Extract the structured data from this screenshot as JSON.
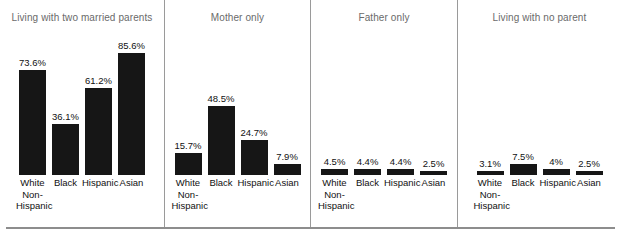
{
  "chart_data": {
    "type": "bar",
    "title": "",
    "xlabel": "",
    "ylabel": "",
    "ylim": [
      0,
      100
    ],
    "grid": false,
    "legend": "none",
    "value_suffix": "%",
    "categories": [
      "White Non-Hispanic",
      "Black",
      "Hispanic",
      "Asian"
    ],
    "panels": [
      {
        "title": "Living with two married parents",
        "categories": [
          "White Non-Hispanic",
          "Black",
          "Hispanic",
          "Asian"
        ],
        "values": [
          73.6,
          36.1,
          61.2,
          85.6
        ],
        "labels": [
          "73.6%",
          "36.1%",
          "61.2%",
          "85.6%"
        ]
      },
      {
        "title": "Mother only",
        "categories": [
          "White Non-Hispanic",
          "Black",
          "Hispanic",
          "Asian"
        ],
        "values": [
          15.7,
          48.5,
          24.7,
          7.9
        ],
        "labels": [
          "15.7%",
          "48.5%",
          "24.7%",
          "7.9%"
        ]
      },
      {
        "title": "Father only",
        "categories": [
          "White Non-Hispanic",
          "Black",
          "Hispanic",
          "Asian"
        ],
        "values": [
          4.5,
          4.4,
          4.4,
          2.5
        ],
        "labels": [
          "4.5%",
          "4.4%",
          "4.4%",
          "2.5%"
        ]
      },
      {
        "title": "Living with no parent",
        "categories": [
          "White Non-Hispanic",
          "Black",
          "Hispanic",
          "Asian"
        ],
        "values": [
          3.1,
          7.5,
          4.0,
          2.5
        ],
        "labels": [
          "3.1%",
          "7.5%",
          "4%",
          "2.5%"
        ]
      }
    ],
    "series": [
      {
        "name": "Living with two married parents",
        "values": [
          73.6,
          36.1,
          61.2,
          85.6
        ]
      },
      {
        "name": "Mother only",
        "values": [
          15.7,
          48.5,
          24.7,
          7.9
        ]
      },
      {
        "name": "Father only",
        "values": [
          4.5,
          4.4,
          4.4,
          2.5
        ]
      },
      {
        "name": "Living with no parent",
        "values": [
          3.1,
          7.5,
          4.0,
          2.5
        ]
      }
    ],
    "colors": {
      "bar": "#161616",
      "title": "#6a6a6a",
      "label": "#111111",
      "divider": "#9a9a9a",
      "rule": "#8d8d8d",
      "background": "#ffffff"
    }
  },
  "category_label_lines": {
    "White Non-Hispanic": [
      "White",
      "Non-",
      "Hispanic"
    ],
    "Black": [
      "Black"
    ],
    "Hispanic": [
      "Hispanic"
    ],
    "Asian": [
      "Asian"
    ]
  }
}
